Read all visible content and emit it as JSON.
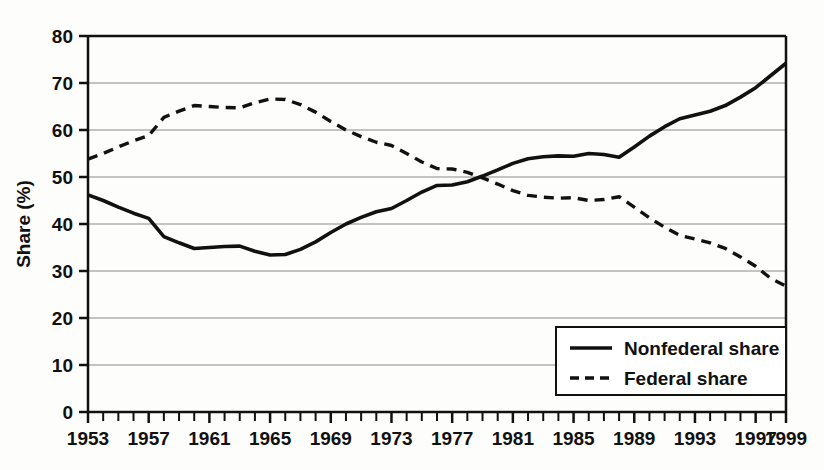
{
  "chart_data": {
    "type": "line",
    "title": "",
    "xlabel": "",
    "ylabel": "Share (%)",
    "xlim": [
      1953,
      1999
    ],
    "ylim": [
      0,
      80
    ],
    "ytick_step": 10,
    "grid": true,
    "legend_position": "bottom-right",
    "xticks": [
      "1953",
      "1957",
      "1961",
      "1965",
      "1969",
      "1973",
      "1977",
      "1981",
      "1985",
      "1989",
      "1993",
      "1997",
      "1999"
    ],
    "yticks": [
      "0",
      "10",
      "20",
      "30",
      "40",
      "50",
      "60",
      "70",
      "80"
    ],
    "x": [
      1953,
      1954,
      1955,
      1956,
      1957,
      1958,
      1959,
      1960,
      1961,
      1962,
      1963,
      1964,
      1965,
      1966,
      1967,
      1968,
      1969,
      1970,
      1971,
      1972,
      1973,
      1974,
      1975,
      1976,
      1977,
      1978,
      1979,
      1980,
      1981,
      1982,
      1983,
      1984,
      1985,
      1986,
      1987,
      1988,
      1989,
      1990,
      1991,
      1992,
      1993,
      1994,
      1995,
      1996,
      1997,
      1998,
      1999
    ],
    "series": [
      {
        "name": "Nonfederal share",
        "style": "solid",
        "color": "#111111",
        "values": [
          46.2,
          45.0,
          43.6,
          42.3,
          41.2,
          37.3,
          36.0,
          34.8,
          35.0,
          35.2,
          35.3,
          34.2,
          33.4,
          33.5,
          34.6,
          36.2,
          38.2,
          40.0,
          41.4,
          42.6,
          43.3,
          45.0,
          46.8,
          48.2,
          48.3,
          49.0,
          50.2,
          51.5,
          52.9,
          53.9,
          54.3,
          54.5,
          54.4,
          55.0,
          54.8,
          54.2,
          56.4,
          58.7,
          60.7,
          62.4,
          63.2,
          64.0,
          65.2,
          67.0,
          69.0,
          71.6,
          74.2
        ]
      },
      {
        "name": "Federal share",
        "style": "dashed",
        "color": "#111111",
        "values": [
          53.8,
          55.0,
          56.4,
          57.7,
          58.8,
          62.7,
          64.0,
          65.2,
          65.0,
          64.8,
          64.7,
          65.8,
          66.6,
          66.5,
          65.4,
          63.8,
          61.8,
          60.0,
          58.6,
          57.4,
          56.7,
          55.0,
          53.2,
          51.8,
          51.7,
          51.0,
          49.8,
          48.5,
          47.1,
          46.1,
          45.7,
          45.5,
          45.6,
          45.0,
          45.2,
          45.8,
          43.6,
          41.3,
          39.3,
          37.6,
          36.8,
          36.0,
          34.8,
          33.0,
          31.0,
          28.4,
          26.8
        ]
      }
    ]
  },
  "legend": {
    "entries": [
      {
        "label": "Nonfederal share",
        "style": "solid"
      },
      {
        "label": "Federal share",
        "style": "dashed"
      }
    ]
  }
}
